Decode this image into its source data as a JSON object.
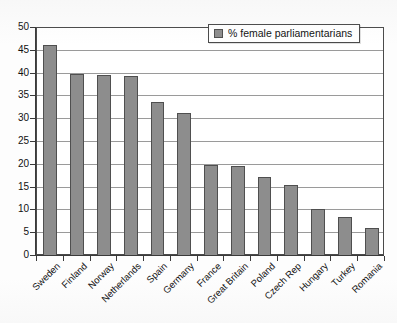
{
  "chart_data": {
    "type": "bar",
    "title": "",
    "xlabel": "",
    "ylabel": "",
    "ylim": [
      0,
      50
    ],
    "ytick_step": 5,
    "yticks": [
      0,
      5,
      10,
      15,
      20,
      25,
      30,
      35,
      40,
      45,
      50
    ],
    "grid": true,
    "legend_position": "top-right",
    "legend_entries": [
      "% female parliamentarians"
    ],
    "series_name": "% female parliamentarians",
    "bar_color": "#8d8d8d",
    "bar_border_color": "#4f4f4f",
    "categories": [
      "Sweden",
      "Finland",
      "Norway",
      "Netherlands",
      "Spain",
      "Germany",
      "France",
      "Great Britain",
      "Poland",
      "Czech Rep",
      "Hungary",
      "Turkey",
      "Romania"
    ],
    "values": [
      46.3,
      40.0,
      39.6,
      39.4,
      33.8,
      31.3,
      19.9,
      19.7,
      17.3,
      15.5,
      10.4,
      8.6,
      6.1
    ]
  },
  "legend": {
    "label": "% female parliamentarians",
    "swatch_color": "#8d8d8d"
  },
  "axes": {
    "y_tick_labels": [
      "50",
      "45",
      "40",
      "35",
      "30",
      "25",
      "20",
      "15",
      "10",
      "5",
      "0"
    ]
  }
}
